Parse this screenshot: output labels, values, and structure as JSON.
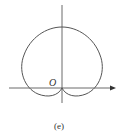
{
  "figure": {
    "caption": "(e)",
    "origin_label": "O",
    "curve": "cardioid",
    "stroke_color": "#555555",
    "axis_color": "#444444"
  }
}
